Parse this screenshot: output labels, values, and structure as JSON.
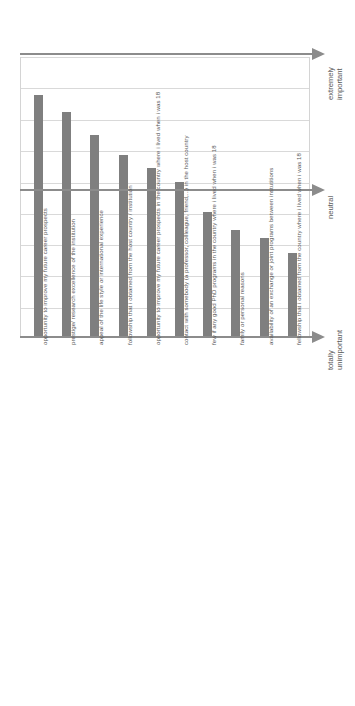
{
  "chart_data": {
    "type": "bar",
    "title": "",
    "subtitle": "",
    "xlabel": "",
    "ylabel": "",
    "orientation": "vertical-rotated-90",
    "grid": true,
    "legend": false,
    "ylim": [
      1,
      5
    ],
    "axis_anchor_labels": [
      {
        "id": "extremely-important",
        "text_line1": "extremely",
        "text_line2": "important",
        "value": 5
      },
      {
        "id": "neutral",
        "text_line1": "neutral",
        "text_line2": "",
        "value": 3
      },
      {
        "id": "totally-unimportant",
        "text_line1": "totally",
        "text_line2": "unimportant",
        "value": 1
      }
    ],
    "categories": [
      "opportunity to improve my future career prospects",
      "prestige/ research excellence of the institution",
      "appeal of the life style or international experience",
      "followship that i obtained from the host country / institution",
      "opportunity to improve my future career prospects in the country where i lived when i was 18",
      "contact with somebody (a professor, collleague, friend,...) in the host country",
      "few if any good PhD programs in the country where i lived when i was 18",
      "family or personal reasons",
      "availability of an exchange or joint programs between instutitions",
      "fellowship that i obtained from the country where i lived when i was 18"
    ],
    "values": [
      4.45,
      4.22,
      3.89,
      3.6,
      3.41,
      3.21,
      2.79,
      2.53,
      2.42,
      2.2
    ],
    "colors": {
      "bar": "#7f7f7f",
      "grid": "#d9d9d9",
      "axis": "#8c8c8c",
      "text": "#595959",
      "background": "#ffffff"
    }
  }
}
